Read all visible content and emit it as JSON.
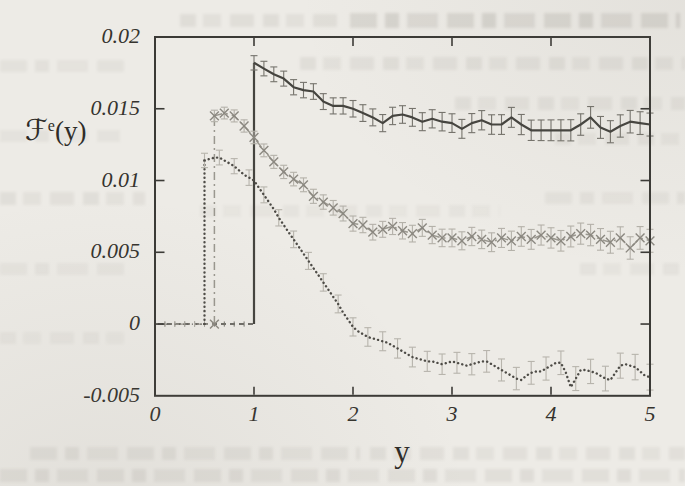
{
  "figure": {
    "background_color": "#edebe6",
    "border_color": "#3b3a36",
    "label_color": "#2e2c28",
    "ylabel_base": "ℱ",
    "ylabel_sup": "e",
    "ylabel_rest": "(y)",
    "xlabel": "y"
  },
  "chart_data": {
    "type": "line",
    "title": "",
    "xlabel": "y",
    "ylabel": "F^e(y)",
    "xlim": [
      0,
      5
    ],
    "ylim": [
      -0.005,
      0.02
    ],
    "grid": false,
    "legend": "none",
    "xticks": {
      "values": [
        0,
        1,
        2,
        3,
        4,
        5
      ],
      "labels": [
        "0",
        "1",
        "2",
        "3",
        "4",
        "5"
      ]
    },
    "yticks": {
      "values": [
        0.02,
        0.015,
        0.01,
        0.005,
        0,
        -0.005
      ],
      "labels": [
        "0.02",
        "0.015",
        "0.01",
        "0.005",
        "0",
        "-0.005"
      ]
    },
    "note": "All three curves are 0 below their threshold, then step up: solid at y=1.0, dashed-x at y=0.6, dotted at y=0.5. Error bars shown.",
    "series": [
      {
        "name": "solid (step at y=1)",
        "style": "solid",
        "color": "#45443f",
        "err_color": "#75736c",
        "marker": "none",
        "zero_from": 0.03,
        "step_x": 1.0,
        "x_start": 1.0,
        "dx": 0.1,
        "err_start": 0.0005,
        "err_end": 0.0008,
        "err_every": 1,
        "values": [
          0.0182,
          0.0178,
          0.0174,
          0.0171,
          0.0165,
          0.0163,
          0.0162,
          0.0155,
          0.0152,
          0.0152,
          0.015,
          0.0147,
          0.0144,
          0.014,
          0.0145,
          0.0146,
          0.0144,
          0.0141,
          0.0143,
          0.0141,
          0.014,
          0.0136,
          0.014,
          0.0142,
          0.0139,
          0.0139,
          0.0144,
          0.0139,
          0.0135,
          0.0135,
          0.0135,
          0.0135,
          0.0135,
          0.0139,
          0.0144,
          0.0137,
          0.0134,
          0.0138,
          0.0141,
          0.014,
          0.0139
        ]
      },
      {
        "name": "dashed with x markers (step at y=0.6)",
        "style": "dashdot",
        "color": "#9a978f",
        "marker_color": "#8b8880",
        "err_color": "#b4b1a9",
        "marker": "x",
        "zero_from": 0.03,
        "step_x": 0.6,
        "x_start": 0.6,
        "dx": 0.1,
        "err_start": 0.0004,
        "err_end": 0.0008,
        "err_every": 1,
        "values": [
          0.0145,
          0.0147,
          0.0145,
          0.0138,
          0.013,
          0.0121,
          0.0113,
          0.0106,
          0.0101,
          0.0097,
          0.0089,
          0.0085,
          0.0081,
          0.0077,
          0.007,
          0.0069,
          0.0064,
          0.0066,
          0.0068,
          0.0065,
          0.0063,
          0.0067,
          0.0062,
          0.006,
          0.006,
          0.0058,
          0.0061,
          0.0059,
          0.0057,
          0.006,
          0.0058,
          0.0061,
          0.0059,
          0.0062,
          0.006,
          0.0058,
          0.0061,
          0.0063,
          0.0062,
          0.0059,
          0.0057,
          0.006,
          0.0053,
          0.006,
          0.0058
        ]
      },
      {
        "name": "dotted (step at y=0.5)",
        "style": "dotted",
        "color": "#4e4c47",
        "err_color": "#b7b4ac",
        "marker": "none",
        "zero_from": 0.03,
        "step_x": 0.5,
        "x_start": 0.5,
        "dx": 0.05,
        "err_start": 0.0005,
        "err_end": 0.0009,
        "err_every": 3,
        "values": [
          0.0114,
          0.0115,
          0.0116,
          0.0116,
          0.0114,
          0.0112,
          0.011,
          0.0107,
          0.0104,
          0.0102,
          0.01,
          0.0095,
          0.009,
          0.0085,
          0.008,
          0.0074,
          0.0069,
          0.0064,
          0.0059,
          0.0054,
          0.0049,
          0.0044,
          0.0039,
          0.0034,
          0.0029,
          0.0024,
          0.0019,
          0.0014,
          0.0008,
          0.0003,
          -0.0002,
          -0.0005,
          -0.0007,
          -0.0009,
          -0.001,
          -0.0011,
          -0.0012,
          -0.0013,
          -0.0015,
          -0.0017,
          -0.0019,
          -0.0021,
          -0.0023,
          -0.0024,
          -0.0025,
          -0.0026,
          -0.0026,
          -0.0027,
          -0.0028,
          -0.0027,
          -0.0026,
          -0.0027,
          -0.0028,
          -0.0029,
          -0.0028,
          -0.0027,
          -0.0026,
          -0.0026,
          -0.0028,
          -0.003,
          -0.0032,
          -0.0034,
          -0.0036,
          -0.0038,
          -0.0039,
          -0.0036,
          -0.0034,
          -0.0033,
          -0.0033,
          -0.0031,
          -0.0029,
          -0.0027,
          -0.0027,
          -0.0034,
          -0.0044,
          -0.0038,
          -0.0032,
          -0.0032,
          -0.0033,
          -0.0034,
          -0.0036,
          -0.0038,
          -0.0039,
          -0.0034,
          -0.0029,
          -0.0028,
          -0.0029,
          -0.003,
          -0.0033,
          -0.0036,
          -0.0037
        ]
      }
    ]
  }
}
